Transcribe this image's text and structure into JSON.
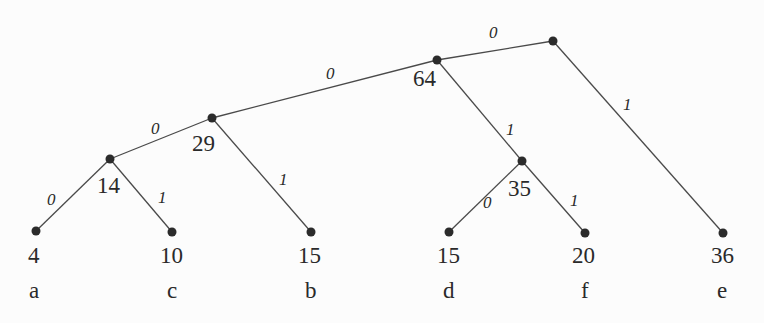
{
  "diagram": {
    "type": "huffman-tree",
    "colors": {
      "edge": "#4a4a4a",
      "node": "#2b2b2b",
      "text": "#2a2a2a",
      "background": "#fcfcfc"
    },
    "leaves": [
      {
        "symbol": "a",
        "weight": "4",
        "x": 36,
        "y": 231
      },
      {
        "symbol": "c",
        "weight": "10",
        "x": 172,
        "y": 232
      },
      {
        "symbol": "b",
        "weight": "15",
        "x": 311,
        "y": 232
      },
      {
        "symbol": "d",
        "weight": "15",
        "x": 449,
        "y": 232
      },
      {
        "symbol": "f",
        "weight": "20",
        "x": 585,
        "y": 233
      },
      {
        "symbol": "e",
        "weight": "36",
        "x": 723,
        "y": 233
      }
    ],
    "internal_nodes": [
      {
        "id": "n14",
        "weight": "14",
        "x": 110,
        "y": 159
      },
      {
        "id": "n29",
        "weight": "29",
        "x": 212,
        "y": 118
      },
      {
        "id": "n35",
        "weight": "35",
        "x": 522,
        "y": 161
      },
      {
        "id": "n64",
        "weight": "64",
        "x": 437,
        "y": 60
      },
      {
        "id": "root",
        "weight": "",
        "x": 553,
        "y": 41
      }
    ],
    "edges": [
      {
        "from": "n14",
        "to": "a",
        "bit": "0"
      },
      {
        "from": "n14",
        "to": "c",
        "bit": "1"
      },
      {
        "from": "n29",
        "to": "n14",
        "bit": "0"
      },
      {
        "from": "n29",
        "to": "b",
        "bit": "1"
      },
      {
        "from": "n35",
        "to": "d",
        "bit": "0"
      },
      {
        "from": "n35",
        "to": "f",
        "bit": "1"
      },
      {
        "from": "n64",
        "to": "n29",
        "bit": "0"
      },
      {
        "from": "n64",
        "to": "n35",
        "bit": "1"
      },
      {
        "from": "root",
        "to": "n64",
        "bit": "0"
      },
      {
        "from": "root",
        "to": "e",
        "bit": "1"
      }
    ]
  }
}
